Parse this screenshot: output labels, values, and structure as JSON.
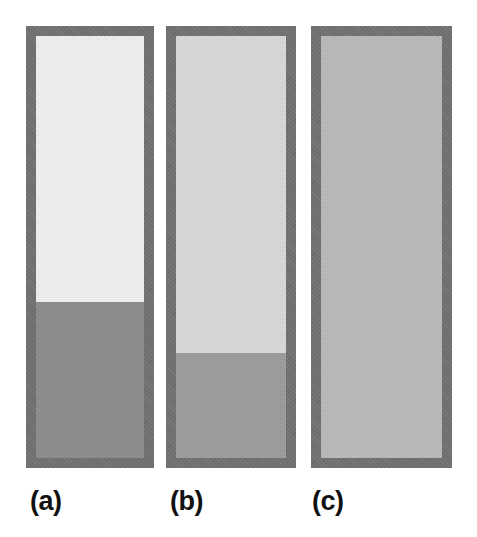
{
  "figure": {
    "background_color": "#ffffff",
    "width": 477,
    "height": 537,
    "caption_font_weight": "bold"
  },
  "chart_data": {
    "type": "bar",
    "title": "",
    "subtitle": "",
    "xlabel": "",
    "ylabel": "",
    "orientation": "vertical",
    "grid": false,
    "legend_position": "none",
    "categories": [
      "(a)",
      "(b)",
      "(c)"
    ],
    "values": [
      37,
      25,
      100
    ],
    "value_units": "percent fill of container height",
    "ylim": [
      0,
      100
    ],
    "annotations": [
      "Panel (a): dense lower layer occupies about 37% of the column height; upper region is near-white.",
      "Panel (b): dense lower layer occupies about 25% of the column height; upper region is light gray.",
      "Panel (c): column is uniform mid-gray throughout with no visible interface."
    ],
    "series": [
      {
        "name": "lower-layer-fill",
        "values": [
          37,
          25,
          100
        ]
      },
      {
        "name": "upper-layer-fill",
        "values": [
          63,
          75,
          0
        ]
      }
    ]
  },
  "panels": [
    {
      "id": "panel-a",
      "label": "(a)",
      "frame_color": "#6e6e6e",
      "upper_color": "#f2f2f2",
      "lower_color": "#909090",
      "lower_fill_percent": 37,
      "has_interface": true,
      "geometry": {
        "left": 26,
        "top": 26,
        "width": 128,
        "height": 442,
        "border": 10
      },
      "label_position": {
        "left": 30,
        "top": 488
      }
    },
    {
      "id": "panel-b",
      "label": "(b)",
      "frame_color": "#6e6e6e",
      "upper_color": "#dcdcdc",
      "lower_color": "#a0a0a0",
      "lower_fill_percent": 25,
      "has_interface": true,
      "geometry": {
        "left": 166,
        "top": 26,
        "width": 130,
        "height": 442,
        "border": 10
      },
      "label_position": {
        "left": 170,
        "top": 488
      }
    },
    {
      "id": "panel-c",
      "label": "(c)",
      "frame_color": "#6e6e6e",
      "upper_color": "#bdbdbd",
      "lower_color": "#bdbdbd",
      "lower_fill_percent": 100,
      "has_interface": false,
      "geometry": {
        "left": 311,
        "top": 26,
        "width": 141,
        "height": 442,
        "border": 10
      },
      "label_position": {
        "left": 312,
        "top": 488
      }
    }
  ]
}
